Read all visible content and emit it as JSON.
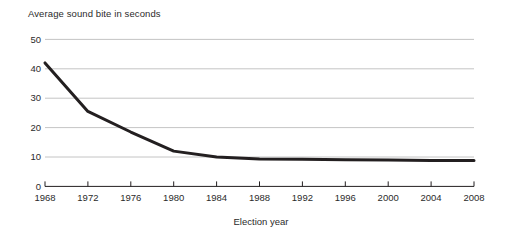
{
  "chart_data": {
    "type": "line",
    "title": "Average sound bite in seconds",
    "xlabel": "Election year",
    "ylabel": "",
    "categories": [
      1968,
      1972,
      1976,
      1980,
      1984,
      1988,
      1992,
      1996,
      2000,
      2004,
      2008
    ],
    "x_tick_labels": [
      "1968",
      "1972",
      "1976",
      "1980",
      "1984",
      "1988",
      "1992",
      "1996",
      "2000",
      "2004",
      "2008"
    ],
    "values": [
      42.0,
      25.5,
      18.5,
      12.0,
      10.0,
      9.3,
      9.2,
      9.1,
      9.0,
      8.8,
      8.8
    ],
    "y_tick_labels": [
      "50",
      "40",
      "30",
      "20",
      "10",
      "0"
    ],
    "y_ticks": [
      50,
      40,
      30,
      20,
      10,
      0
    ],
    "ylim": [
      0,
      50
    ],
    "xlim": [
      1968,
      2008
    ],
    "grid": "horizontal",
    "legend": "none",
    "series": [
      {
        "name": "Average sound bite in seconds",
        "values": [
          42.0,
          25.5,
          18.5,
          12.0,
          10.0,
          9.3,
          9.2,
          9.1,
          9.0,
          8.8,
          8.8
        ],
        "color": "#231f20",
        "line_width": 3
      }
    ],
    "colors": {
      "line": "#231f20",
      "grid": "#b5b5b5",
      "axis": "#231f20",
      "text": "#2b2b2b",
      "background": "#ffffff"
    }
  }
}
